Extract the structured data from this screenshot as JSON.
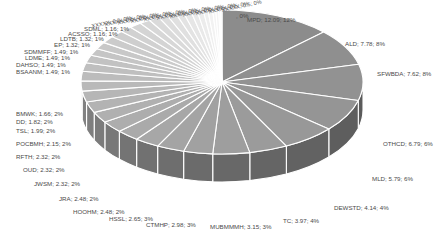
{
  "chart_data": {
    "type": "pie",
    "style": "3d-exploded-labels",
    "title": "",
    "label_format": "{name}; {value}; {percent}",
    "slices": [
      {
        "name": "MPD",
        "value": 12.09,
        "percent": "12%"
      },
      {
        "name": "ALD",
        "value": 7.78,
        "percent": "8%"
      },
      {
        "name": "SFWBDA",
        "value": 7.62,
        "percent": "8%"
      },
      {
        "name": "OTHCD",
        "value": 6.79,
        "percent": "6%"
      },
      {
        "name": "MLD",
        "value": 5.79,
        "percent": "6%"
      },
      {
        "name": "DEWSTD",
        "value": 4.14,
        "percent": "4%"
      },
      {
        "name": "TC",
        "value": 3.97,
        "percent": "4%"
      },
      {
        "name": "MUBMMMH",
        "value": 3.15,
        "percent": "3%"
      },
      {
        "name": "CTMHP",
        "value": 2.98,
        "percent": "3%"
      },
      {
        "name": "HSSL",
        "value": 2.65,
        "percent": "3%"
      },
      {
        "name": "HOOHM",
        "value": 2.48,
        "percent": "2%"
      },
      {
        "name": "JRA",
        "value": 2.48,
        "percent": "2%"
      },
      {
        "name": "JWSM",
        "value": 2.32,
        "percent": "2%"
      },
      {
        "name": "OUD",
        "value": 2.32,
        "percent": "2%"
      },
      {
        "name": "RFTH",
        "value": 2.32,
        "percent": "2%"
      },
      {
        "name": "POCBMH",
        "value": 2.15,
        "percent": "2%"
      },
      {
        "name": "TSL",
        "value": 1.99,
        "percent": "2%"
      },
      {
        "name": "DD",
        "value": 1.82,
        "percent": "2%"
      },
      {
        "name": "BMWK",
        "value": 1.66,
        "percent": "2%"
      },
      {
        "name": "BSAANM",
        "value": 1.49,
        "percent": "1%"
      },
      {
        "name": "DAHSO",
        "value": 1.49,
        "percent": "1%"
      },
      {
        "name": "LDME",
        "value": 1.49,
        "percent": "1%"
      },
      {
        "name": "SDMMFF",
        "value": 1.49,
        "percent": "1%"
      },
      {
        "name": "EP",
        "value": 1.32,
        "percent": "1%"
      },
      {
        "name": "LDTB",
        "value": 1.32,
        "percent": "1%"
      },
      {
        "name": "ACSSO",
        "value": 1.16,
        "percent": "1%"
      },
      {
        "name": "SDML",
        "value": 1.16,
        "percent": "1%"
      },
      {
        "name": "small-1",
        "value": 0.99,
        "percent": "1%"
      },
      {
        "name": "small-2",
        "value": 0.99,
        "percent": "1%"
      },
      {
        "name": "small-3",
        "value": 0.83,
        "percent": "1%"
      },
      {
        "name": "small-4",
        "value": 0.83,
        "percent": "1%"
      },
      {
        "name": "small-5",
        "value": 0.66,
        "percent": "1%"
      },
      {
        "name": "small-6",
        "value": 0.66,
        "percent": "1%"
      },
      {
        "name": "small-7",
        "value": 0.5,
        "percent": "0%"
      },
      {
        "name": "small-8",
        "value": 0.5,
        "percent": "0%"
      },
      {
        "name": "small-9",
        "value": 0.33,
        "percent": "0%"
      },
      {
        "name": "small-10",
        "value": 0.33,
        "percent": "0%"
      },
      {
        "name": "small-11",
        "value": 0.17,
        "percent": "0%"
      },
      {
        "name": "small-12",
        "value": 0.17,
        "percent": "0%"
      }
    ],
    "legend": "none"
  },
  "labels": [
    {
      "text": "MPD; 12.09; 12%",
      "x": 247,
      "y": 22
    },
    {
      "text": "ALD; 7.78; 8%",
      "x": 345,
      "y": 46
    },
    {
      "text": "SFWBDA; 7.62; 8%",
      "x": 377,
      "y": 76
    },
    {
      "text": "OTHCD; 6.79; 6%",
      "x": 383,
      "y": 146
    },
    {
      "text": "MLD; 5.79; 6%",
      "x": 372,
      "y": 181
    },
    {
      "text": "DEWSTD; 4.14; 4%",
      "x": 334,
      "y": 210
    },
    {
      "text": "TC; 3.97; 4%",
      "x": 283,
      "y": 223
    },
    {
      "text": "MUBMMMH; 3.15; 3%",
      "x": 210,
      "y": 229
    },
    {
      "text": "CTMHP; 2.98; 3%",
      "x": 146,
      "y": 227
    },
    {
      "text": "HSSL; 2.65; 3%",
      "x": 109,
      "y": 221
    },
    {
      "text": "HOOHM; 2.48; 2%",
      "x": 73,
      "y": 214
    },
    {
      "text": "JRA; 2.48; 2%",
      "x": 59,
      "y": 201
    },
    {
      "text": "JWSM; 2.32; 2%",
      "x": 34,
      "y": 186
    },
    {
      "text": "OUD; 2.32; 2%",
      "x": 23,
      "y": 172
    },
    {
      "text": "RFTH; 2.32; 2%",
      "x": 16,
      "y": 159
    },
    {
      "text": "POCBMH; 2.15; 2%",
      "x": 16,
      "y": 146
    },
    {
      "text": "TSL; 1.99; 2%",
      "x": 16,
      "y": 133
    },
    {
      "text": "DD; 1.82; 2%",
      "x": 16,
      "y": 124
    },
    {
      "text": "BMWK; 1.66; 2%",
      "x": 16,
      "y": 116
    },
    {
      "text": "BSAANM; 1.49; 1%",
      "x": 16,
      "y": 74
    },
    {
      "text": "DAHSO; 1.49; 1%",
      "x": 16,
      "y": 67
    },
    {
      "text": "LDME; 1.49; 1%",
      "x": 25,
      "y": 60
    },
    {
      "text": "SDMMFF; 1.49; 1%",
      "x": 24,
      "y": 54
    },
    {
      "text": "EP; 1.32; 1%",
      "x": 54,
      "y": 47
    },
    {
      "text": "LDTB; 1.32; 1%",
      "x": 60,
      "y": 41
    },
    {
      "text": "ACSSO; 1.16; 1%",
      "x": 68,
      "y": 36
    },
    {
      "text": "SDML; 1.16; 1%",
      "x": 84,
      "y": 31
    }
  ],
  "dense_labels_tail": {
    "text": ", 0%",
    "x": 236,
    "y": 18
  },
  "colors": {
    "background": "#ffffff",
    "top_dark": "#8c8c8c",
    "top_light": "#f4f4f4",
    "side_dark": "#555555",
    "side_light": "#bdbdbd",
    "separator": "#ffffff",
    "label_text": "#4a4a4a"
  },
  "geometry": {
    "cx": 222,
    "cy": 82,
    "rx": 141,
    "ry": 72,
    "depth": 28,
    "start_angle_deg": -90
  }
}
